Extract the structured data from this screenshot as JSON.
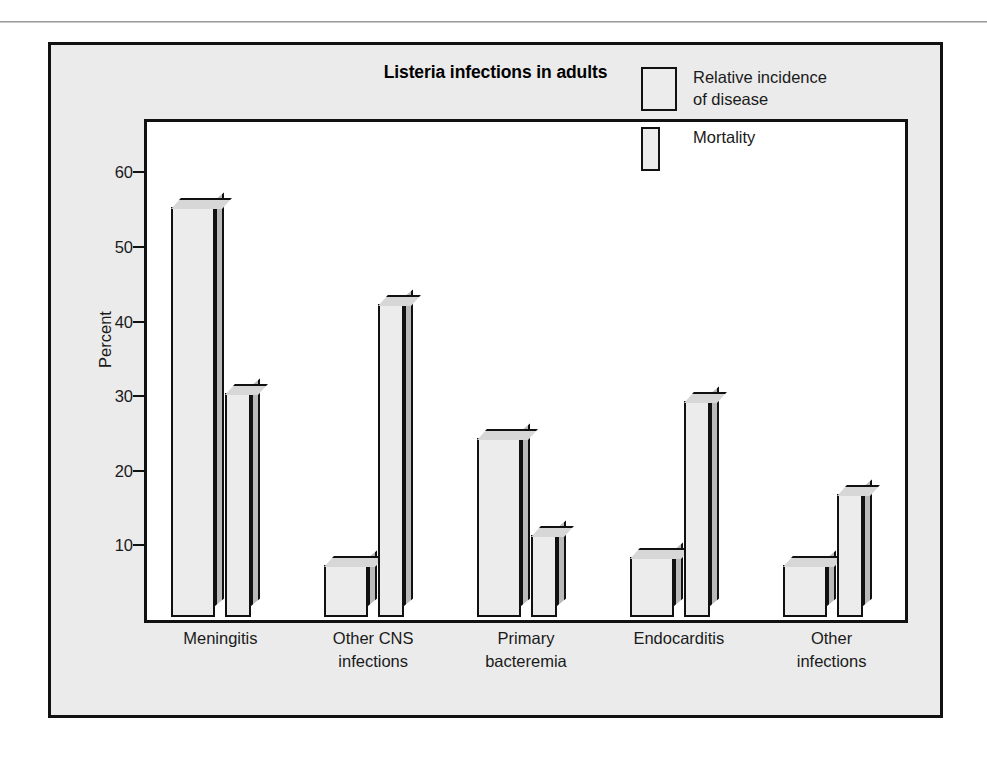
{
  "figure": {
    "title": "Listeria infections in adults",
    "background_color": "#ebebeb",
    "plot_background_color": "#ffffff",
    "border_color": "#111111",
    "bar_face_color": "#ececec",
    "bar_side_color": "#b9b9b9"
  },
  "legend": {
    "position": "top-right",
    "entries": [
      {
        "label": "Relative incidence\nof disease",
        "swatch": "wide"
      },
      {
        "label": "Mortality",
        "swatch": "narrow"
      }
    ]
  },
  "chart_data": {
    "type": "bar",
    "title": "Listeria infections in adults",
    "xlabel": "",
    "ylabel": "Percent",
    "ylim": [
      0,
      65
    ],
    "yticks": [
      10,
      20,
      30,
      40,
      50,
      60
    ],
    "ytick_labels": [
      "10",
      "20",
      "30",
      "40",
      "50",
      "60"
    ],
    "grid": false,
    "legend_position": "top-right",
    "categories": [
      "Meningitis",
      "Other CNS\ninfections",
      "Primary\nbacteremia",
      "Endocarditis",
      "Other\ninfections"
    ],
    "series": [
      {
        "name": "Relative incidence of disease",
        "values": [
          55,
          7,
          24,
          8,
          7
        ]
      },
      {
        "name": "Mortality",
        "values": [
          30,
          42,
          11,
          29,
          16.5
        ]
      }
    ]
  }
}
